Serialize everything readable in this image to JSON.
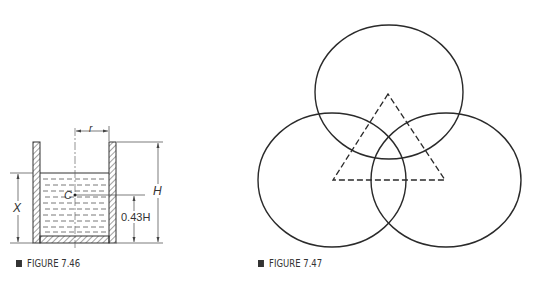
{
  "figures": [
    {
      "id": "fig-7-46",
      "caption": "FIGURE 7.46",
      "labels": {
        "radius": "r",
        "center": "C",
        "height": "H",
        "depth": "X",
        "center_height": "0.43H"
      }
    },
    {
      "id": "fig-7-47",
      "caption": "FIGURE 7.47",
      "shapes": {
        "circles": [
          {
            "cx": 389,
            "cy": 92,
            "rx": 74,
            "ry": 67
          },
          {
            "cx": 332,
            "cy": 180,
            "rx": 74,
            "ry": 67
          },
          {
            "cx": 446,
            "cy": 180,
            "rx": 75,
            "ry": 67
          }
        ],
        "triangle": {
          "apex": [
            388,
            94
          ],
          "left": [
            333,
            180
          ],
          "right": [
            445,
            180
          ],
          "style": "dashed"
        }
      }
    }
  ],
  "colors": {
    "ink": "#333333",
    "background": "#ffffff"
  }
}
